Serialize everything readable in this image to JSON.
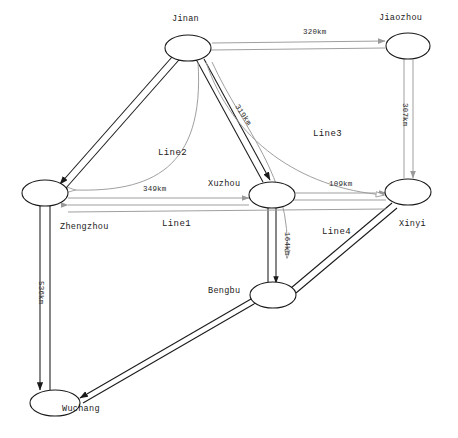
{
  "diagram": {
    "background_color": "#ffffff",
    "stroke_dark": "#1a1a1a",
    "stroke_light": "#a8a8a8"
  },
  "nodes": [
    {
      "id": "jinan",
      "label": "Jinan",
      "cx": 188,
      "cy": 48,
      "rx": 23,
      "ry": 13,
      "label_x": 172,
      "label_y": 14
    },
    {
      "id": "jiaozhou",
      "label": "Jiaozhou",
      "cx": 408,
      "cy": 46,
      "rx": 22,
      "ry": 13,
      "label_x": 379,
      "label_y": 13
    },
    {
      "id": "zhengzhou",
      "label": "Zhengzhou",
      "cx": 45,
      "cy": 193,
      "rx": 23,
      "ry": 13,
      "label_x": 60,
      "label_y": 222
    },
    {
      "id": "xuzhou",
      "label": "Xuzhou",
      "cx": 272,
      "cy": 195,
      "rx": 23,
      "ry": 13,
      "label_x": 208,
      "label_y": 179
    },
    {
      "id": "xinyi",
      "label": "Xinyi",
      "cx": 408,
      "cy": 192,
      "rx": 23,
      "ry": 13,
      "label_x": 399,
      "label_y": 219
    },
    {
      "id": "bengbu",
      "label": "Bengbu",
      "cx": 273,
      "cy": 295,
      "rx": 23,
      "ry": 13,
      "label_x": 208,
      "label_y": 286
    },
    {
      "id": "wuchang",
      "label": "Wuchang",
      "cx": 55,
      "cy": 403,
      "rx": 25,
      "ry": 13,
      "label_x": 62,
      "label_y": 404
    }
  ],
  "distance_labels": [
    {
      "id": "d-320",
      "text": "320km",
      "x": 303,
      "y": 28,
      "rotate": 0,
      "edge": "jinan-jiaozhou"
    },
    {
      "id": "d-307",
      "text": "307km",
      "x": 409,
      "y": 103,
      "rotate": 90,
      "edge": "jiaozhou-xinyi"
    },
    {
      "id": "d-319",
      "text": "319km",
      "x": 240,
      "y": 103,
      "rotate": 57,
      "edge": "jinan-xuzhou"
    },
    {
      "id": "d-349",
      "text": "349km",
      "x": 143,
      "y": 185,
      "rotate": 0,
      "edge": "zhengzhou-xuzhou"
    },
    {
      "id": "d-109",
      "text": "109km",
      "x": 329,
      "y": 180,
      "rotate": 0,
      "edge": "xuzhou-xinyi"
    },
    {
      "id": "d-164",
      "text": "164km",
      "x": 291,
      "y": 232,
      "rotate": 90,
      "edge": "xuzhou-bengbu"
    },
    {
      "id": "d-536",
      "text": "536km",
      "x": 45,
      "y": 281,
      "rotate": 90,
      "edge": "zhengzhou-wuchang"
    }
  ],
  "line_labels": [
    {
      "id": "line1",
      "text": "Line1",
      "x": 162,
      "y": 219
    },
    {
      "id": "line2",
      "text": "Line2",
      "x": 158,
      "y": 148
    },
    {
      "id": "line3",
      "text": "Line3",
      "x": 313,
      "y": 129
    },
    {
      "id": "line4",
      "text": "Line4",
      "x": 322,
      "y": 227
    }
  ]
}
